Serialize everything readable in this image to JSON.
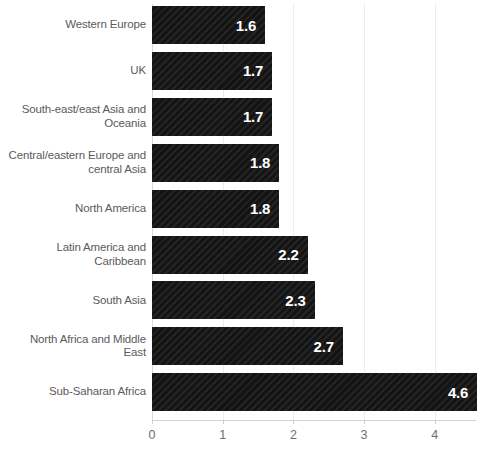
{
  "chart_data": {
    "type": "bar",
    "orientation": "horizontal",
    "title": "",
    "subtitle": "",
    "xlabel": "",
    "ylabel": "",
    "categories": [
      "Western Europe",
      "UK",
      "South-east/east Asia and Oceania",
      "Central/eastern Europe and central Asia",
      "North America",
      "Latin America and Caribbean",
      "South Asia",
      "North Africa and Middle East",
      "Sub-Saharan Africa"
    ],
    "values": [
      1.6,
      1.7,
      1.7,
      1.8,
      1.8,
      2.2,
      2.3,
      2.7,
      4.6
    ],
    "data_labels": [
      "1.6",
      "1.7",
      "1.7",
      "1.8",
      "1.8",
      "2.2",
      "2.3",
      "2.7",
      "4.6"
    ],
    "xticks": [
      0,
      1,
      2,
      3,
      4
    ],
    "xtick_labels": [
      "0",
      "1",
      "2",
      "3",
      "4"
    ],
    "xlim": [
      0,
      4.6
    ],
    "grid": true,
    "grid_axis": "x",
    "legend": null,
    "bar_color": "#141414",
    "bar_pattern": "diagonal-hatch",
    "data_label_color": "#ffffff",
    "category_label_color": "#5b5b5b",
    "tick_label_color": "#6e6e6e",
    "gridline_color": "#ededed",
    "axis_color": "#d2d2d2",
    "background_color": "#ffffff"
  }
}
